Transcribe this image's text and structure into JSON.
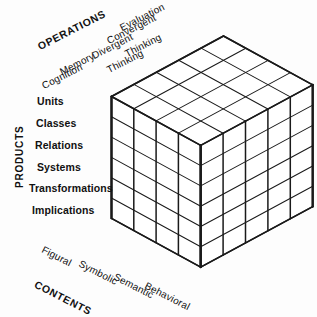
{
  "figure": {
    "name": "structure-of-intellect-cube",
    "background_color": "#fdfdfd",
    "line_color": "#1a1a1a",
    "text_color": "#111111"
  },
  "axes": {
    "operations": {
      "title": "OPERATIONS",
      "count": 5,
      "items": [
        {
          "label": "Evaluation"
        },
        {
          "label": "Convergent"
        },
        {
          "label": "Thinking"
        },
        {
          "label": "Divergent"
        },
        {
          "label": "Thinking"
        },
        {
          "label": "Memory"
        },
        {
          "label": "Cognition"
        }
      ],
      "categories": [
        "Evaluation",
        "Convergent Thinking",
        "Divergent Thinking",
        "Memory",
        "Cognition"
      ]
    },
    "products": {
      "title": "PRODUCTS",
      "count": 6,
      "items": [
        {
          "label": "Units"
        },
        {
          "label": "Classes"
        },
        {
          "label": "Relations"
        },
        {
          "label": "Systems"
        },
        {
          "label": "Transformations"
        },
        {
          "label": "Implications"
        }
      ]
    },
    "contents": {
      "title": "CONTENTS",
      "count": 4,
      "items": [
        {
          "label": "Figural"
        },
        {
          "label": "Symbolic"
        },
        {
          "label": "Semantic"
        },
        {
          "label": "Behavioral"
        }
      ]
    }
  },
  "chart_data": {
    "type": "diagram",
    "dimensions": {
      "operations": 5,
      "products": 6,
      "contents": 4
    },
    "total_cells": 120,
    "grid": {
      "top_face": {
        "cols": 5,
        "rows": 4
      },
      "left_face": {
        "cols": 4,
        "rows": 6
      },
      "right_face": {
        "cols": 5,
        "rows": 6
      }
    }
  }
}
